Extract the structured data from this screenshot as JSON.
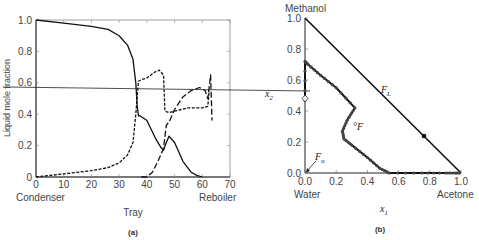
{
  "chart_data": [
    {
      "id": "a",
      "type": "line",
      "caption": "(a)",
      "title": "",
      "xlabel": "Tray",
      "ylabel": "Liquid mole fraction",
      "xlim": [
        0,
        70
      ],
      "ylim": [
        0,
        1.0
      ],
      "x_ticks": [
        "0",
        "10",
        "20",
        "30",
        "40",
        "50",
        "60",
        "70"
      ],
      "y_ticks": [
        "0",
        "0.2",
        "0.4",
        "0.6",
        "0.8",
        "1.0"
      ],
      "x_end_labels": {
        "left": "Condenser",
        "right": "Reboiler"
      },
      "grid": false,
      "series": [
        {
          "name": "Acetone",
          "style": "solid",
          "x": [
            0,
            10,
            20,
            26,
            30,
            33,
            35,
            36,
            36.5,
            37,
            37.5,
            40,
            43,
            45,
            46,
            47,
            48,
            50,
            53,
            56,
            58,
            60
          ],
          "y": [
            1.0,
            0.98,
            0.96,
            0.94,
            0.9,
            0.84,
            0.75,
            0.6,
            0.45,
            0.39,
            0.39,
            0.36,
            0.25,
            0.19,
            0.17,
            0.22,
            0.26,
            0.22,
            0.1,
            0.03,
            0.01,
            0.0
          ]
        },
        {
          "name": "Methanol",
          "style": "short-dash",
          "x": [
            0,
            10,
            20,
            26,
            30,
            33,
            35,
            36,
            37,
            38,
            40,
            43,
            44.5,
            46,
            46.5,
            48,
            50,
            55,
            60,
            62,
            62.5
          ],
          "y": [
            0.0,
            0.02,
            0.04,
            0.06,
            0.09,
            0.14,
            0.22,
            0.4,
            0.61,
            0.62,
            0.63,
            0.67,
            0.68,
            0.65,
            0.42,
            0.41,
            0.42,
            0.44,
            0.44,
            0.45,
            0.55
          ]
        },
        {
          "name": "Water",
          "style": "long-dash",
          "x": [
            38,
            40,
            42,
            44,
            46,
            47,
            48,
            50,
            53,
            56,
            59,
            61,
            62,
            63,
            63.5
          ],
          "y": [
            0.0,
            0.0,
            0.03,
            0.1,
            0.18,
            0.33,
            0.35,
            0.43,
            0.51,
            0.55,
            0.57,
            0.55,
            0.5,
            0.65,
            0.36
          ]
        }
      ],
      "annotations": [
        "horizontal line at ~0.575 extending to panel (b) x2 axis"
      ]
    },
    {
      "id": "b",
      "type": "line",
      "caption": "(b)",
      "title": "",
      "xlabel": "x1",
      "ylabel": "x2",
      "xlim": [
        0,
        1.0
      ],
      "ylim": [
        0,
        1.0
      ],
      "x_ticks": [
        "0.0",
        "0.2",
        "0.4",
        "0.6",
        "0.8",
        "1.0"
      ],
      "y_ticks": [
        "0.0",
        "0.2",
        "0.4",
        "0.6",
        "0.8",
        "1.0"
      ],
      "corner_labels": {
        "top": "Methanol",
        "bottom_left": "Water",
        "bottom_right": "Acetone"
      },
      "grid": false,
      "series": [
        {
          "name": "Composition profile",
          "style": "solid-with-markers",
          "x": [
            0.0,
            0.0,
            0.02,
            0.1,
            0.2,
            0.32,
            0.27,
            0.24,
            0.25,
            0.3,
            0.4,
            0.48,
            0.54,
            0.75,
            0.9,
            0.96,
            1.0
          ],
          "y": [
            0.47,
            0.72,
            0.7,
            0.63,
            0.55,
            0.42,
            0.34,
            0.27,
            0.22,
            0.18,
            0.1,
            0.03,
            0.0,
            0.0,
            0.0,
            0.0,
            0.0
          ]
        },
        {
          "name": "Triangle hypotenuse",
          "style": "solid",
          "x": [
            0.0,
            1.0
          ],
          "y": [
            1.0,
            0.0
          ]
        }
      ],
      "annotations": [
        {
          "text": "F_L",
          "x": 0.5,
          "y": 0.5
        },
        {
          "text": "F",
          "x": 0.3,
          "y": 0.28
        },
        {
          "text": "F_u",
          "x": 0.0,
          "y": 0.0
        },
        {
          "text": "Feed point F_L marker",
          "x": 0.76,
          "y": 0.24
        }
      ]
    }
  ],
  "panel_a": {
    "ylabel": "Liquid mole fraction",
    "xlabel": "Tray",
    "left_end": "Condenser",
    "right_end": "Reboiler",
    "caption": "(a)",
    "x_ticks": [
      "0",
      "10",
      "20",
      "30",
      "40",
      "50",
      "60",
      "70"
    ],
    "y_ticks": [
      "0",
      "0.2",
      "0.4",
      "0.6",
      "0.8",
      "1.0"
    ]
  },
  "panel_b": {
    "top_label": "Methanol",
    "left_label": "Water",
    "right_label": "Acetone",
    "xlabel": "x",
    "xlabel_sub": "1",
    "ylabel": "x",
    "ylabel_sub": "2",
    "caption": "(b)",
    "fl_label": "F",
    "fl_sub": "L",
    "f_label": "°F",
    "fu_label": "F",
    "fu_sub": "u",
    "x_ticks": [
      "0.0",
      "0.2",
      "0.4",
      "0.6",
      "0.8",
      "1.0"
    ],
    "y_ticks": [
      "0.0",
      "0.2",
      "0.4",
      "0.6",
      "0.8",
      "1.0"
    ]
  }
}
